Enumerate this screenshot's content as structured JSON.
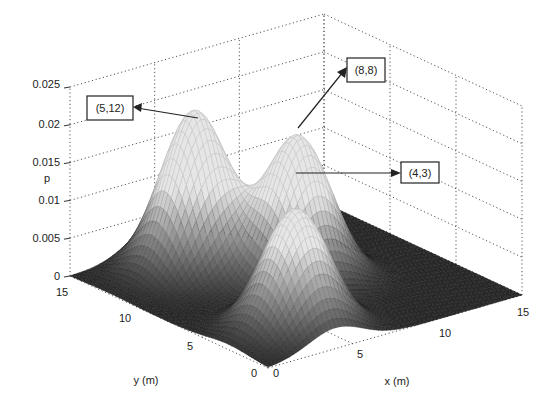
{
  "chart_data": {
    "type": "surface3d",
    "title": "",
    "xlabel": "x (m)",
    "ylabel": "y (m)",
    "zlabel": "p",
    "xlim": [
      0,
      15
    ],
    "ylim": [
      0,
      15
    ],
    "zlim": [
      0,
      0.025
    ],
    "x_ticks": [
      "0",
      "5",
      "10",
      "15"
    ],
    "y_ticks": [
      "0",
      "5",
      "10",
      "15"
    ],
    "z_ticks": [
      "0",
      "0.005",
      "0.01",
      "0.015",
      "0.02",
      "0.025"
    ],
    "grid": true,
    "colormap": "gray",
    "peaks": [
      {
        "label": "(5,12)",
        "x": 5,
        "y": 12,
        "z": 0.021
      },
      {
        "label": "(8,8)",
        "x": 8,
        "y": 8,
        "z": 0.019
      },
      {
        "label": "(4,3)",
        "x": 4,
        "y": 3,
        "z": 0.016
      }
    ],
    "annotations": [
      "(5,12)",
      "(8,8)",
      "(4,3)"
    ]
  },
  "axes": {
    "xlabel": "x (m)",
    "ylabel": "y (m)",
    "zlabel": "p",
    "x_ticks": [
      "0",
      "5",
      "10",
      "15"
    ],
    "y_ticks": [
      "0",
      "5",
      "10",
      "15"
    ],
    "z_ticks": [
      "0",
      "0.005",
      "0.01",
      "0.015",
      "0.02",
      "0.025"
    ]
  },
  "callouts": [
    {
      "label": "(5,12)"
    },
    {
      "label": "(8,8)"
    },
    {
      "label": "(4,3)"
    }
  ]
}
